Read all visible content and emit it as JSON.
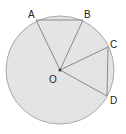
{
  "diagram": {
    "type": "circle-geometry",
    "colors": {
      "disk_fill": "#e4e4e4",
      "disk_stroke": "#a8a8a8",
      "line": "#8a8a8a",
      "center_dot": "#444444",
      "label": "#222222"
    },
    "circle": {
      "cx": 60,
      "cy": 70,
      "r": 54
    },
    "points": {
      "A": {
        "label": "A",
        "x": 36,
        "y": 20
      },
      "B": {
        "label": "B",
        "x": 83,
        "y": 20
      },
      "C": {
        "label": "C",
        "x": 108,
        "y": 47
      },
      "D": {
        "label": "D",
        "x": 107,
        "y": 96
      },
      "O": {
        "label": "O",
        "x": 60,
        "y": 70
      }
    },
    "segments": [
      [
        "O",
        "A"
      ],
      [
        "O",
        "B"
      ],
      [
        "A",
        "B"
      ],
      [
        "O",
        "C"
      ],
      [
        "O",
        "D"
      ],
      [
        "C",
        "D"
      ]
    ]
  }
}
